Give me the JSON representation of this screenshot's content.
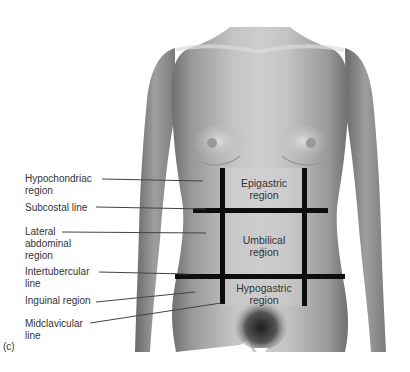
{
  "figure": {
    "panel_label": "(c)",
    "labels": [
      {
        "text": "Hypochondriac\nregion",
        "x": 25,
        "y": 173
      },
      {
        "text": "Subcostal line",
        "x": 25,
        "y": 202
      },
      {
        "text": "Lateral\nabdominal\nregion",
        "x": 25,
        "y": 226
      },
      {
        "text": "Intertubercular\nline",
        "x": 25,
        "y": 266
      },
      {
        "text": "Inguinal region",
        "x": 25,
        "y": 295
      },
      {
        "text": "Midclavicular\nline",
        "x": 25,
        "y": 318
      }
    ],
    "regions": [
      {
        "text": "Epigastric\nregion",
        "x": 263,
        "y": 177
      },
      {
        "text": "Umbilical\nregion",
        "x": 263,
        "y": 234
      },
      {
        "text": "Hypogastric\nregion",
        "x": 263,
        "y": 283
      }
    ],
    "colors": {
      "skin_light": "#c9c9c9",
      "skin_mid": "#a8a8a8",
      "skin_dark": "#7a7a7a",
      "grid_line": "#0d0d0d",
      "leader_line": "#444444",
      "text": "#333333"
    }
  }
}
